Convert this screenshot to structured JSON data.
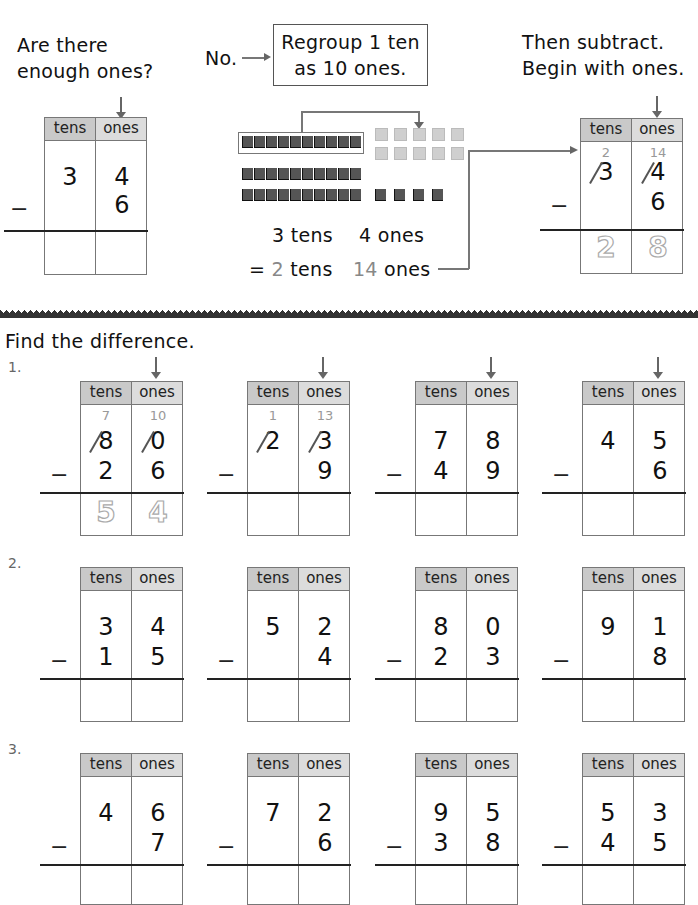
{
  "example": {
    "question": [
      "Are there",
      "enough ones?"
    ],
    "answer_no": "No.",
    "regroup_box": [
      "Regroup 1 ten",
      "as 10 ones."
    ],
    "then_text": [
      "Then subtract.",
      "Begin with ones."
    ],
    "before": {
      "tens": "3",
      "ones": "4",
      "sub_ones": "6"
    },
    "after": {
      "new_tens": "2",
      "new_ones": "14",
      "tens": "3",
      "ones": "4",
      "sub_ones": "6",
      "ans_tens": "2",
      "ans_ones": "8"
    },
    "line1": {
      "a": "3 tens",
      "b": "4 ones"
    },
    "line2": {
      "eq": "=",
      "tens_num": "2",
      "tens_word": "tens",
      "ones_num": "14",
      "ones_word": "ones"
    }
  },
  "headers": {
    "tens": "tens",
    "ones": "ones"
  },
  "minus": "−",
  "instructions": "Find the difference.",
  "rows": [
    {
      "label": "1.",
      "problems": [
        {
          "top_tens": "8",
          "top_ones": "0",
          "sub_tens": "2",
          "sub_ones": "6",
          "new_tens": "7",
          "new_ones": "10",
          "ans_tens": "5",
          "ans_ones": "4",
          "crossed": true
        },
        {
          "top_tens": "2",
          "top_ones": "3",
          "sub_tens": "",
          "sub_ones": "9",
          "new_tens": "1",
          "new_ones": "13",
          "ans_tens": "",
          "ans_ones": "",
          "crossed": true
        },
        {
          "top_tens": "7",
          "top_ones": "8",
          "sub_tens": "4",
          "sub_ones": "9"
        },
        {
          "top_tens": "4",
          "top_ones": "5",
          "sub_tens": "",
          "sub_ones": "6"
        }
      ]
    },
    {
      "label": "2.",
      "problems": [
        {
          "top_tens": "3",
          "top_ones": "4",
          "sub_tens": "1",
          "sub_ones": "5"
        },
        {
          "top_tens": "5",
          "top_ones": "2",
          "sub_tens": "",
          "sub_ones": "4"
        },
        {
          "top_tens": "8",
          "top_ones": "0",
          "sub_tens": "2",
          "sub_ones": "3"
        },
        {
          "top_tens": "9",
          "top_ones": "1",
          "sub_tens": "",
          "sub_ones": "8"
        }
      ]
    },
    {
      "label": "3.",
      "problems": [
        {
          "top_tens": "4",
          "top_ones": "6",
          "sub_tens": "",
          "sub_ones": "7"
        },
        {
          "top_tens": "7",
          "top_ones": "2",
          "sub_tens": "",
          "sub_ones": "6"
        },
        {
          "top_tens": "9",
          "top_ones": "5",
          "sub_tens": "3",
          "sub_ones": "8"
        },
        {
          "top_tens": "5",
          "top_ones": "3",
          "sub_tens": "4",
          "sub_ones": "5"
        }
      ]
    }
  ]
}
